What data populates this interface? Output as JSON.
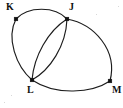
{
  "diagram": {
    "background_color": "#ffffff",
    "stroke_color": "#1c1c1c",
    "label_color": "#111111",
    "width": 123,
    "height": 108
  },
  "vertices": [
    {
      "id": "K",
      "label": "K",
      "x": 16,
      "y": 19,
      "label_x": 6,
      "label_y": 2,
      "degree": 2
    },
    {
      "id": "J",
      "label": "J",
      "x": 67,
      "y": 19,
      "label_x": 69,
      "label_y": 2,
      "degree": 4
    },
    {
      "id": "L",
      "label": "L",
      "x": 32,
      "y": 80,
      "label_x": 27,
      "label_y": 85,
      "degree": 4
    },
    {
      "id": "M",
      "label": "M",
      "x": 110,
      "y": 81,
      "label_x": 112,
      "label_y": 85,
      "degree": 2
    }
  ],
  "edges": [
    {
      "id": "edge-kj",
      "from": "K",
      "to": "J",
      "shape": "arc-up",
      "path": "M 16 19 C 28 6, 55 6, 67 19"
    },
    {
      "id": "edge-kl",
      "from": "K",
      "to": "L",
      "shape": "arc-left",
      "path": "M 16 19 C 6 38, 16 66, 32 80"
    },
    {
      "id": "edge-lj1",
      "from": "L",
      "to": "J",
      "shape": "arc-left",
      "path": "M 32 80 C 34 56, 48 31, 67 19"
    },
    {
      "id": "edge-lj2",
      "from": "L",
      "to": "J",
      "shape": "arc-right",
      "path": "M 32 80 C 50 70, 66 46, 67 19"
    },
    {
      "id": "edge-jm",
      "from": "J",
      "to": "M",
      "shape": "arc-right",
      "path": "M 67 19 C 94 24, 118 50, 110 81"
    },
    {
      "id": "edge-lm",
      "from": "L",
      "to": "M",
      "shape": "arc-down",
      "path": "M 32 80 C 56 96, 92 93, 110 81"
    }
  ],
  "legend": {
    "vertex_count": 4,
    "edge_count": 6
  }
}
